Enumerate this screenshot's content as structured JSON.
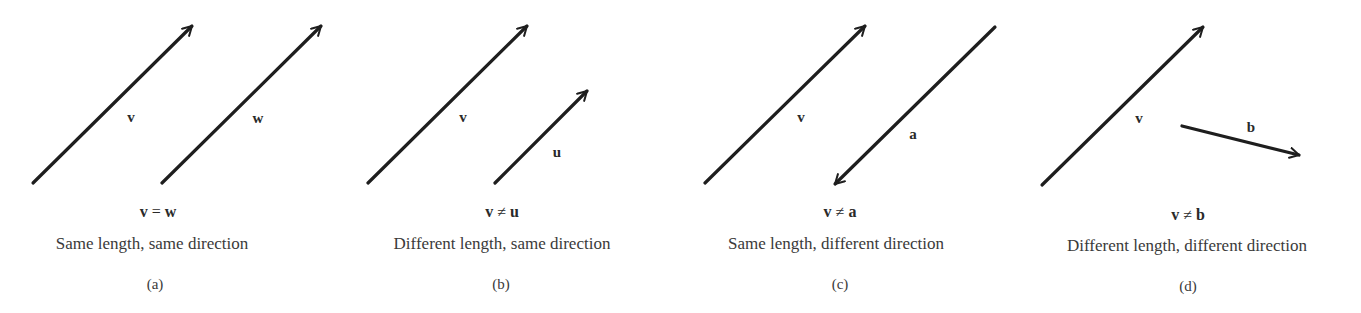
{
  "figure": {
    "panels": [
      {
        "id": "(a)",
        "relation": {
          "left": "v",
          "op": "=",
          "right": "w"
        },
        "caption": "Same length, same direction",
        "vectors": [
          {
            "name": "v",
            "label": "v"
          },
          {
            "name": "w",
            "label": "w"
          }
        ]
      },
      {
        "id": "(b)",
        "relation": {
          "left": "v",
          "op": "≠",
          "right": "u"
        },
        "caption": "Different length, same direction",
        "vectors": [
          {
            "name": "v",
            "label": "v"
          },
          {
            "name": "u",
            "label": "u"
          }
        ]
      },
      {
        "id": "(c)",
        "relation": {
          "left": "v",
          "op": "≠",
          "right": "a"
        },
        "caption": "Same length, different direction",
        "vectors": [
          {
            "name": "v",
            "label": "v"
          },
          {
            "name": "a",
            "label": "a"
          }
        ]
      },
      {
        "id": "(d)",
        "relation": {
          "left": "v",
          "op": "≠",
          "right": "b"
        },
        "caption": "Different length, different direction",
        "vectors": [
          {
            "name": "v",
            "label": "v"
          },
          {
            "name": "b",
            "label": "b"
          }
        ]
      }
    ],
    "colors": {
      "stroke": "#1e1e1e",
      "text": "#2a2a2a",
      "background": "#ffffff"
    }
  }
}
